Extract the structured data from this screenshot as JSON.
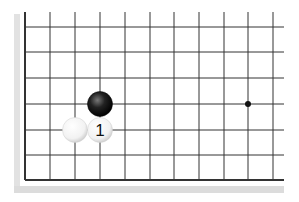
{
  "diagram": {
    "type": "go-board-fragment",
    "board_color": "#ffffff",
    "line_color": "#333333",
    "shadow_color": "#d8d8d8",
    "grid": {
      "x_lines": [
        25,
        50,
        75,
        100,
        125,
        150,
        174,
        199,
        224,
        248,
        273
      ],
      "y_lines": [
        27,
        52,
        78,
        104,
        130,
        155,
        180
      ],
      "top_y": 12,
      "right_x": 284,
      "left_border_x": 25,
      "bottom_border_y": 180
    },
    "star_points": [
      {
        "x": 248,
        "y": 104
      }
    ],
    "stones": [
      {
        "color": "black",
        "x": 100,
        "y": 104,
        "label": ""
      },
      {
        "color": "white",
        "x": 75,
        "y": 130,
        "label": ""
      },
      {
        "color": "white",
        "x": 100,
        "y": 130,
        "label": "1"
      }
    ]
  }
}
